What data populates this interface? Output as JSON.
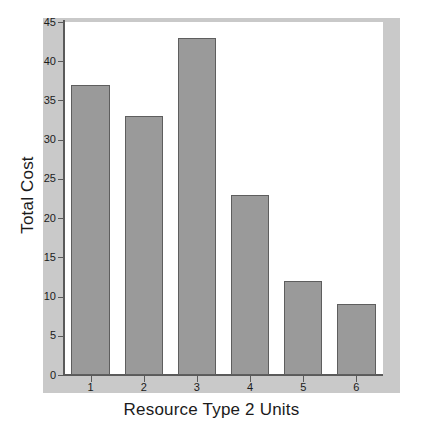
{
  "chart_data": {
    "type": "bar",
    "title": "",
    "xlabel": "Resource Type 2 Units",
    "ylabel": "Total Cost",
    "categories": [
      "1",
      "2",
      "3",
      "4",
      "5",
      "6"
    ],
    "values": [
      37,
      33,
      43,
      23,
      12,
      9
    ],
    "ylim": [
      0,
      45
    ],
    "yticks": [
      0,
      5,
      10,
      15,
      20,
      25,
      30,
      35,
      40,
      45
    ],
    "ytick_labels": [
      "0",
      "5",
      "10",
      "15",
      "20",
      "25",
      "30",
      "35",
      "40",
      "45"
    ],
    "grid": false,
    "legend": null,
    "bar_color": "#9a9a9a",
    "bar_border_color": "#5e5e5e",
    "plot_background": "#ffffff",
    "frame_color": "#c9c9c9",
    "axis_color": "#5a5a5a",
    "text_color": "#1b1b1b"
  }
}
